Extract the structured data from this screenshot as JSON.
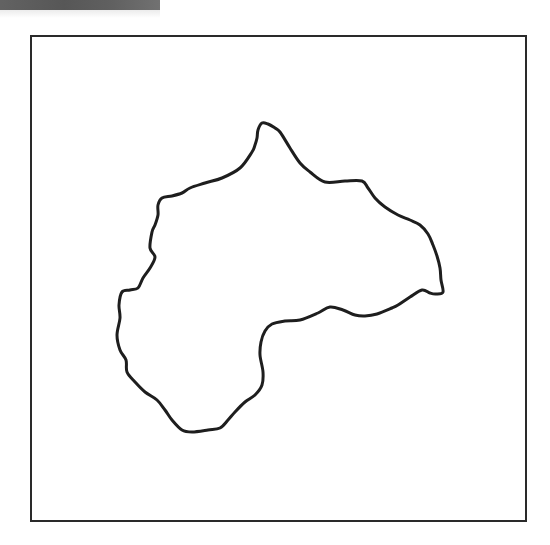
{
  "figure": {
    "type": "outline-map",
    "colors": {
      "background": "#ffffff",
      "frame_stroke": "#2a2a2a",
      "outline_stroke": "#1e1e1e",
      "scan_band": "#555555"
    },
    "frame": {
      "x": 30,
      "y": 35,
      "width": 495,
      "height": 485
    },
    "outline_points": [
      [
        262,
        123
      ],
      [
        268,
        124
      ],
      [
        275,
        128
      ],
      [
        280,
        132
      ],
      [
        290,
        148
      ],
      [
        300,
        163
      ],
      [
        310,
        172
      ],
      [
        325,
        182
      ],
      [
        345,
        181
      ],
      [
        362,
        181
      ],
      [
        368,
        188
      ],
      [
        375,
        198
      ],
      [
        385,
        207
      ],
      [
        398,
        215
      ],
      [
        410,
        220
      ],
      [
        420,
        225
      ],
      [
        428,
        234
      ],
      [
        433,
        245
      ],
      [
        437,
        256
      ],
      [
        440,
        268
      ],
      [
        441,
        280
      ],
      [
        443,
        292
      ],
      [
        436,
        294
      ],
      [
        430,
        293
      ],
      [
        422,
        290
      ],
      [
        410,
        297
      ],
      [
        398,
        305
      ],
      [
        392,
        308
      ],
      [
        377,
        314
      ],
      [
        365,
        316
      ],
      [
        355,
        315
      ],
      [
        343,
        310
      ],
      [
        330,
        307
      ],
      [
        318,
        313
      ],
      [
        300,
        320
      ],
      [
        285,
        321
      ],
      [
        272,
        324
      ],
      [
        265,
        331
      ],
      [
        261,
        342
      ],
      [
        260,
        355
      ],
      [
        263,
        372
      ],
      [
        262,
        385
      ],
      [
        255,
        395
      ],
      [
        245,
        402
      ],
      [
        235,
        412
      ],
      [
        228,
        420
      ],
      [
        220,
        428
      ],
      [
        208,
        430
      ],
      [
        192,
        432
      ],
      [
        182,
        430
      ],
      [
        172,
        420
      ],
      [
        165,
        410
      ],
      [
        157,
        400
      ],
      [
        145,
        392
      ],
      [
        135,
        382
      ],
      [
        127,
        372
      ],
      [
        126,
        360
      ],
      [
        120,
        350
      ],
      [
        117,
        335
      ],
      [
        120,
        318
      ],
      [
        119,
        305
      ],
      [
        122,
        292
      ],
      [
        130,
        290
      ],
      [
        138,
        288
      ],
      [
        143,
        278
      ],
      [
        150,
        268
      ],
      [
        155,
        257
      ],
      [
        150,
        248
      ],
      [
        152,
        232
      ],
      [
        155,
        225
      ],
      [
        158,
        215
      ],
      [
        158,
        205
      ],
      [
        162,
        198
      ],
      [
        172,
        196
      ],
      [
        182,
        193
      ],
      [
        190,
        188
      ],
      [
        205,
        183
      ],
      [
        222,
        178
      ],
      [
        240,
        168
      ],
      [
        252,
        152
      ],
      [
        255,
        145
      ],
      [
        257,
        138
      ],
      [
        258,
        130
      ]
    ]
  }
}
